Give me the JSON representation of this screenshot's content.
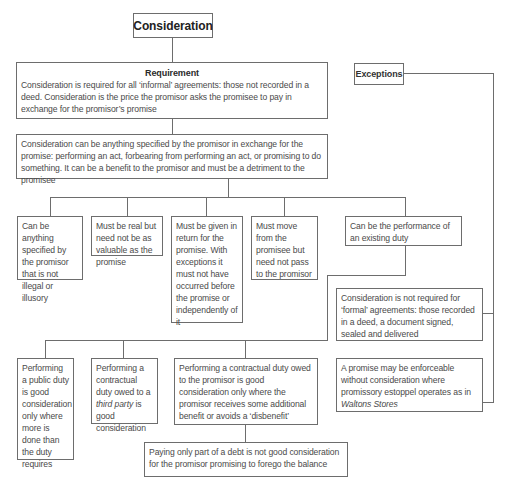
{
  "root": {
    "title": "Consideration"
  },
  "requirement": {
    "heading": "Requirement",
    "text": "Consideration is required for all ‘informal’ agreements: those not recorded in a deed. Consideration is the price the promisor asks the promisee to pay in exchange for the promisor’s promise"
  },
  "definition": {
    "text": "Consideration can be anything specified by the promisor in exchange for the promise: performing an act, forbearing from performing an act, or promising to do something. It can be a benefit to the promisor and must be a detriment to the promisee"
  },
  "rules": [
    {
      "text": "Can be anything specified by the promisor that is not illegal or illusory"
    },
    {
      "text": "Must be real but need not be as valuable as the promise"
    },
    {
      "text": "Must be given in return for the promise. With exceptions it must not have occurred before the promise or independently of it"
    },
    {
      "text": "Must move from the promisee but need not pass to the promisor"
    },
    {
      "text": "Can be the performance of an existing duty"
    }
  ],
  "existing_duty": [
    {
      "text": "Performing a public duty is good consideration only where more is done than the duty requires"
    },
    {
      "text_before": "Performing a contractual duty owed to a ",
      "italic": "third party",
      "text_after": " is good consideration"
    },
    {
      "text": "Performing a contractual duty owed to the promisor is good consideration only where the promisor receives some additional benefit or avoids a ‘disbenefit’"
    }
  ],
  "part_payment": {
    "text": "Paying only part of a debt is not good consideration for the promisor promising to forego the balance"
  },
  "exceptions": {
    "title": "Exceptions",
    "items": [
      {
        "text": "Consideration is not required for ‘formal’ agreements: those recorded in a deed, a document signed, sealed and delivered"
      },
      {
        "text_before": "A promise may be enforceable without consideration where promissory estoppel operates as in ",
        "italic": "Waltons Stores",
        "text_after": ""
      }
    ]
  }
}
